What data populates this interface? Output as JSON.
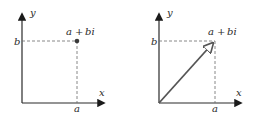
{
  "diagrams": [
    {
      "id": "point",
      "y_axis_label": "y",
      "x_axis_label": "x",
      "real_tick_label": "a",
      "imag_tick_label": "b",
      "point_label": {
        "a": "a",
        "plus": "+",
        "bi": "bi"
      },
      "marker": "dot"
    },
    {
      "id": "vector",
      "y_axis_label": "y",
      "x_axis_label": "x",
      "real_tick_label": "a",
      "imag_tick_label": "b",
      "point_label": {
        "a": "a",
        "plus": "+",
        "bi": "bi"
      },
      "marker": "arrow"
    }
  ],
  "colors": {
    "ink": "#2a2a2a",
    "dash": "#6a6a6a",
    "vector": "#555555"
  }
}
